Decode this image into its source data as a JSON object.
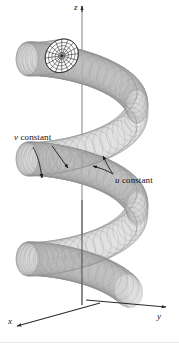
{
  "figure": {
    "kind": "3d-parametric-surface-diagram",
    "background_color": "#ffffff",
    "mesh_color": "#9a9a9a",
    "mesh_color_light": "#c2c2c2",
    "surface_fill": "#f2f2f2",
    "cap_color": "#1a1a1a",
    "axis_color": "#2b2b2b",
    "leader_color": "#1a1a1a",
    "text_color": "#111111"
  },
  "labels": {
    "v_constant": {
      "var": "v",
      "text": " constant"
    },
    "u_constant": {
      "var": "u",
      "text": " constant"
    }
  },
  "axes": {
    "z": "z",
    "y": "y",
    "x": "x",
    "origin": {
      "x": 100,
      "y": 305
    },
    "z_tip": {
      "x": 82,
      "y": 6
    },
    "y_tip": {
      "x": 168,
      "y": 306
    },
    "x_tip": {
      "x": 14,
      "y": 327
    }
  },
  "geometry": {
    "turns": 2.6,
    "tube_radius_px": 17,
    "helix_radius_x_px": 55,
    "helix_radius_y_px": 17,
    "top_y_px": 40,
    "bottom_y_px": 300,
    "u_curves_count": 28,
    "v_curves_count": 96
  }
}
